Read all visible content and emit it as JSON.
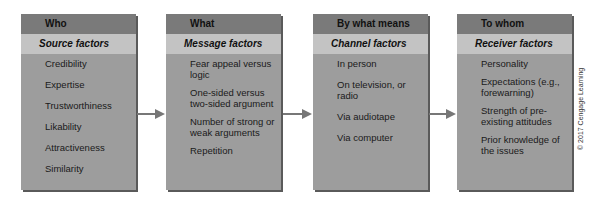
{
  "columns": [
    {
      "header": "Who",
      "subheader": "Source factors",
      "items": [
        "Credibility",
        "Expertise",
        "Trustworthiness",
        "Likability",
        "Attractiveness",
        "Similarity"
      ]
    },
    {
      "header": "What",
      "subheader": "Message factors",
      "items": [
        "Fear appeal versus logic",
        "One-sided versus two-sided argument",
        "Number of strong or weak arguments",
        "Repetition"
      ]
    },
    {
      "header": "By what means",
      "subheader": "Channel factors",
      "items": [
        "In person",
        "On television, or radio",
        "Via audiotape",
        "Via computer"
      ]
    },
    {
      "header": "To whom",
      "subheader": "Receiver factors",
      "items": [
        "Personality",
        "Expectations (e.g., forewarning)",
        "Strength of pre-existing attitudes",
        "Prior knowledge of the issues"
      ]
    }
  ],
  "copyright": "© 2017 Cengage Learning"
}
